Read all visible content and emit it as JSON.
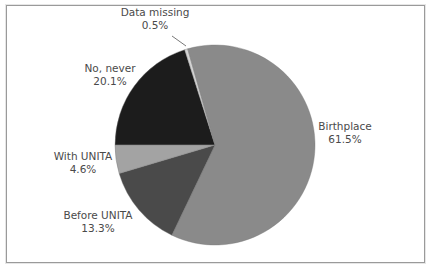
{
  "chart_data": {
    "type": "pie",
    "title": "",
    "start_angle_deg": 270,
    "direction": "clockwise",
    "slices": [
      {
        "label": "No, never",
        "value": 20.1,
        "value_label": "20.1%",
        "color": "#1c1c1c"
      },
      {
        "label": "Data missing",
        "value": 0.5,
        "value_label": "0.5%",
        "color": "#d4d4d4"
      },
      {
        "label": "Birthplace",
        "value": 61.5,
        "value_label": "61.5%",
        "color": "#8a8a8a"
      },
      {
        "label": "Before UNITA",
        "value": 13.3,
        "value_label": "13.3%",
        "color": "#4a4a4a"
      },
      {
        "label": "With UNITA",
        "value": 4.6,
        "value_label": "4.6%",
        "color": "#a3a3a3"
      }
    ],
    "legend": "none (direct labels)"
  },
  "labels": {
    "no_never": {
      "name": "No, never",
      "pct": "20.1%"
    },
    "data_missing": {
      "name": "Data missing",
      "pct": "0.5%"
    },
    "birthplace": {
      "name": "Birthplace",
      "pct": "61.5%"
    },
    "before_unita": {
      "name": "Before UNITA",
      "pct": "13.3%"
    },
    "with_unita": {
      "name": "With UNITA",
      "pct": "4.6%"
    }
  }
}
